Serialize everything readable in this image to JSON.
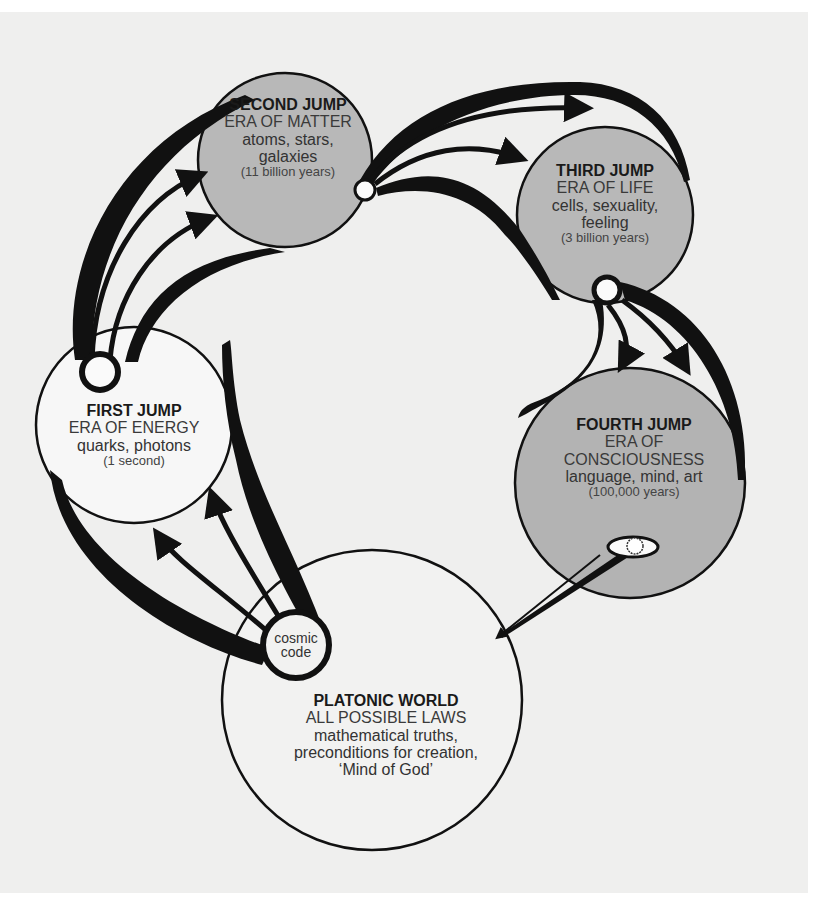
{
  "colors": {
    "background": "#efefee",
    "stroke": "#111111",
    "filled_circle": "#b5b5b5",
    "empty_circle": "#f8f8f8"
  },
  "nodes": {
    "first_jump": {
      "title": "FIRST JUMP",
      "era": "ERA OF ENERGY",
      "desc": [
        "quarks, photons"
      ],
      "duration": "(1 second)"
    },
    "second_jump": {
      "title": "SECOND JUMP",
      "era": "ERA OF MATTER",
      "desc": [
        "atoms, stars,",
        "galaxies"
      ],
      "duration": "(11 billion years)"
    },
    "third_jump": {
      "title": "THIRD JUMP",
      "era": "ERA OF LIFE",
      "desc": [
        "cells, sexuality,",
        "feeling"
      ],
      "duration": "(3 billion years)"
    },
    "fourth_jump": {
      "title": "FOURTH JUMP",
      "era": [
        "ERA OF",
        "CONSCIOUSNESS"
      ],
      "desc": [
        "language, mind, art"
      ],
      "duration": "(100,000 years)"
    },
    "platonic_world": {
      "title": "PLATONIC WORLD",
      "era": "ALL POSSIBLE LAWS",
      "desc": [
        "mathematical truths,",
        "preconditions for creation,",
        "‘Mind of God’"
      ]
    }
  },
  "cosmic_code": [
    "cosmic",
    "code"
  ],
  "icons": {
    "eye": "eye-icon"
  }
}
